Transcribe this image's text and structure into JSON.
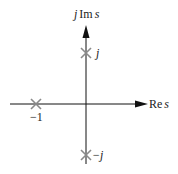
{
  "diagram": {
    "type": "s-plane pole plot",
    "axes": {
      "real_label_prefix": "Re",
      "real_label_var": "s",
      "imag_label_j": "j",
      "imag_label_prefix": "Im",
      "imag_label_var": "s"
    },
    "poles": [
      {
        "name": "pole-minus-one",
        "value": "-1",
        "label": "−1",
        "re": -1,
        "im": 0
      },
      {
        "name": "pole-plus-j",
        "value": "j",
        "label": "j",
        "re": 0,
        "im": 1
      },
      {
        "name": "pole-minus-j",
        "value": "-j",
        "label": "−j",
        "re": 0,
        "im": -1
      }
    ],
    "colors": {
      "axis": "#111111",
      "marker": "#8a8a8a",
      "text": "#222222"
    }
  }
}
